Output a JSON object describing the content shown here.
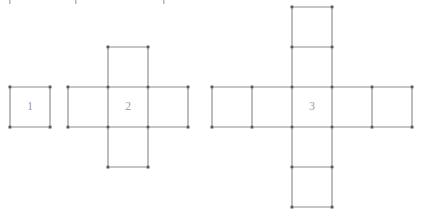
{
  "diagram": {
    "type": "matchstick-pattern-sequence",
    "background_color": "#ffffff",
    "line_color": "#8c8c8c",
    "vertex_color": "#5a5a5a",
    "label_color": "#9a9a9a",
    "cell_size_px": 40,
    "figures": [
      {
        "label": "1",
        "shape": "single-square",
        "arm_length": 0,
        "square_count": 1,
        "label_x": 30,
        "label_y": 107,
        "cells": [
          {
            "col": 0,
            "row": 0
          }
        ],
        "origin_x": 10,
        "origin_y": 87
      },
      {
        "label": "2",
        "shape": "plus-cross",
        "arm_length": 1,
        "square_count": 5,
        "label_x": 128,
        "label_y": 107,
        "cells": [
          {
            "col": 1,
            "row": 0
          },
          {
            "col": 0,
            "row": 1
          },
          {
            "col": 1,
            "row": 1
          },
          {
            "col": 2,
            "row": 1
          },
          {
            "col": 1,
            "row": 2
          }
        ],
        "origin_x": 68,
        "origin_y": 47
      },
      {
        "label": "3",
        "shape": "plus-cross",
        "arm_length": 2,
        "square_count": 9,
        "label_x": 312,
        "label_y": 107,
        "cells": [
          {
            "col": 2,
            "row": 0
          },
          {
            "col": 2,
            "row": 1
          },
          {
            "col": 0,
            "row": 2
          },
          {
            "col": 1,
            "row": 2
          },
          {
            "col": 2,
            "row": 2
          },
          {
            "col": 3,
            "row": 2
          },
          {
            "col": 4,
            "row": 2
          },
          {
            "col": 2,
            "row": 3
          },
          {
            "col": 2,
            "row": 4
          }
        ],
        "origin_x": 212,
        "origin_y": 7
      }
    ],
    "crop_remnants": [
      {
        "x": 9,
        "y": 0,
        "w": 1.6,
        "h": 4
      },
      {
        "x": 75,
        "y": 0,
        "w": 1.6,
        "h": 4
      },
      {
        "x": 163,
        "y": 0,
        "w": 1.6,
        "h": 4
      }
    ]
  }
}
